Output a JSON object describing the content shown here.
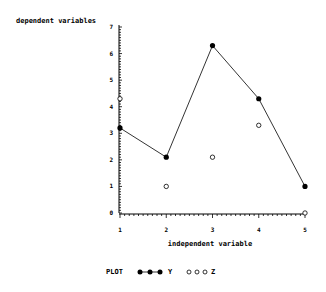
{
  "chart_data": {
    "type": "scatter",
    "title": "",
    "xlabel": "independent variable",
    "ylabel": "dependent variables",
    "x": [
      1,
      2,
      3,
      4,
      5
    ],
    "xlim": [
      1,
      5
    ],
    "ylim": [
      0,
      7
    ],
    "x_ticks": [
      "1",
      "2",
      "3",
      "4",
      "5"
    ],
    "y_ticks": [
      "0",
      "1",
      "2",
      "3",
      "4",
      "5",
      "6",
      "7"
    ],
    "grid": false,
    "legend_position": "bottom",
    "legend_title": "PLOT",
    "series": [
      {
        "name": "Y",
        "marker": "filled-circle",
        "line": true,
        "values": [
          3.2,
          2.1,
          6.3,
          4.3,
          1.0
        ]
      },
      {
        "name": "Z",
        "marker": "open-circle",
        "line": false,
        "values": [
          4.3,
          1.0,
          2.1,
          3.3,
          0.0
        ]
      }
    ]
  }
}
